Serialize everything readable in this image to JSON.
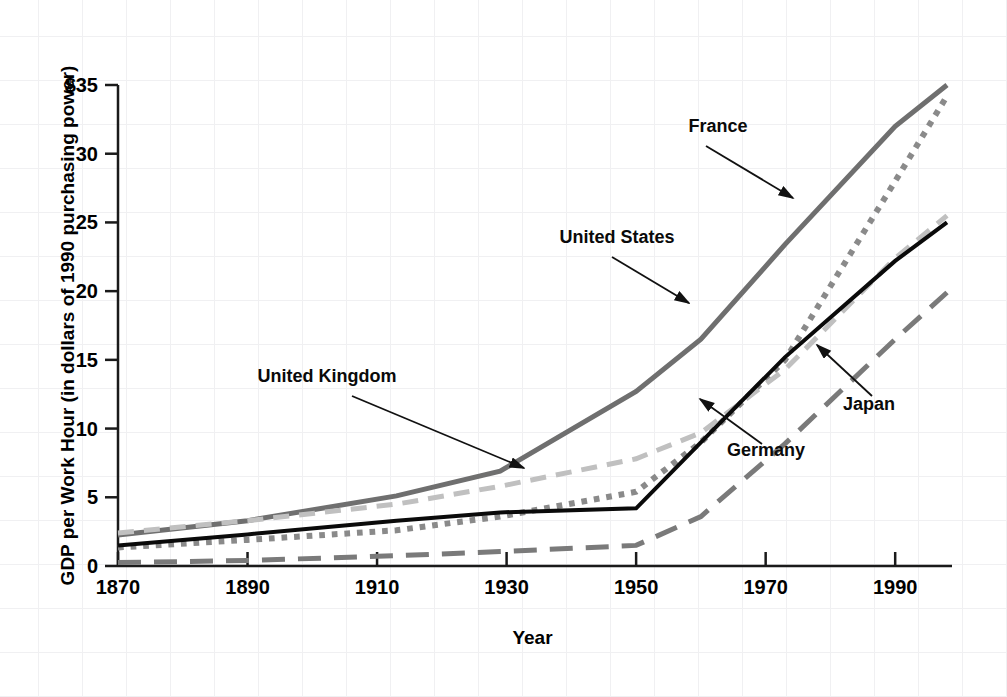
{
  "chart_data": {
    "type": "line",
    "title": "",
    "xlabel": "Year",
    "ylabel": "GDP per Work Hour (in dollars of 1990 purchasing power)",
    "xlim": [
      1870,
      1998
    ],
    "ylim": [
      0,
      35
    ],
    "grid": true,
    "legend_position": "inline-annotations",
    "x_tick_labels": [
      "1870",
      "1890",
      "1910",
      "1930",
      "1950",
      "1970",
      "1990"
    ],
    "x_ticks": [
      1870,
      1890,
      1910,
      1930,
      1950,
      1970,
      1990
    ],
    "y_tick_labels": [
      "0",
      "5",
      "10",
      "15",
      "20",
      "25",
      "30",
      "$35"
    ],
    "y_ticks": [
      0,
      5,
      10,
      15,
      20,
      25,
      30,
      35
    ],
    "x": [
      1870,
      1890,
      1913,
      1929,
      1950,
      1960,
      1973,
      1990,
      1998
    ],
    "series": [
      {
        "name": "United States",
        "style": "solid",
        "color": "#6f6f6f",
        "width": 5,
        "values": [
          2.25,
          3.3,
          5.1,
          6.9,
          12.7,
          16.5,
          23.4,
          32.0,
          35.0
        ]
      },
      {
        "name": "France",
        "style": "dotted",
        "color": "#8a8a8a",
        "width": 6,
        "values": [
          1.35,
          1.9,
          2.6,
          3.6,
          5.4,
          9.0,
          15.0,
          28.0,
          34.2
        ]
      },
      {
        "name": "United Kingdom",
        "style": "dashed-light",
        "color": "#c0c0c0",
        "width": 5,
        "values": [
          2.4,
          3.3,
          4.5,
          5.8,
          7.8,
          9.7,
          14.3,
          22.4,
          25.5
        ]
      },
      {
        "name": "Germany",
        "style": "solid-black",
        "color": "#0a0a0a",
        "width": 4,
        "values": [
          1.5,
          2.3,
          3.3,
          3.9,
          4.2,
          9.0,
          15.2,
          22.2,
          25.0
        ]
      },
      {
        "name": "Japan",
        "style": "long-dash",
        "color": "#7a7a7a",
        "width": 5,
        "values": [
          0.25,
          0.4,
          0.75,
          1.05,
          1.5,
          3.6,
          8.9,
          16.5,
          19.9
        ]
      }
    ],
    "annotations": [
      {
        "label": "France",
        "text_x": 718,
        "text_y": 132,
        "arrow_from_x": 706,
        "arrow_from_y": 146,
        "arrow_to_x": 793,
        "arrow_to_y": 198
      },
      {
        "label": "United States",
        "text_x": 617,
        "text_y": 243,
        "arrow_from_x": 612,
        "arrow_from_y": 257,
        "arrow_to_x": 689,
        "arrow_to_y": 303
      },
      {
        "label": "United Kingdom",
        "text_x": 327,
        "text_y": 382,
        "arrow_from_x": 352,
        "arrow_from_y": 396,
        "arrow_to_x": 524,
        "arrow_to_y": 468
      },
      {
        "label": "Japan",
        "text_x": 869,
        "text_y": 410,
        "arrow_from_x": 872,
        "arrow_from_y": 396,
        "arrow_to_x": 817,
        "arrow_to_y": 345
      },
      {
        "label": "Germany",
        "text_x": 766,
        "text_y": 456,
        "arrow_from_x": 762,
        "arrow_from_y": 444,
        "arrow_to_x": 700,
        "arrow_to_y": 399
      }
    ]
  }
}
